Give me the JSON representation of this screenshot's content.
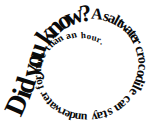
{
  "figure": {
    "kind": "spiral-text-graphic",
    "full_text": "Did you know? A saltwater crocodile can stay underwater for more than an hour.",
    "background_color": "#ffffff",
    "text_color": "#0a0a0a",
    "spiral_direction": "clockwise-inward",
    "center": {
      "x": 78,
      "y": 65
    },
    "words": [
      {
        "text": "Did",
        "size": 26
      },
      {
        "text": "you",
        "size": 25
      },
      {
        "text": "know?",
        "size": 23
      },
      {
        "text": "A",
        "size": 16
      },
      {
        "text": "saltwater",
        "size": 15
      },
      {
        "text": "crocodile",
        "size": 14
      },
      {
        "text": "can",
        "size": 13
      },
      {
        "text": "stay",
        "size": 13
      },
      {
        "text": "underwater",
        "size": 12
      },
      {
        "text": "for",
        "size": 11
      },
      {
        "text": "more",
        "size": 11
      },
      {
        "text": "than",
        "size": 10
      },
      {
        "text": "an",
        "size": 10
      },
      {
        "text": "hour.",
        "size": 9
      }
    ],
    "letters": [
      {
        "ch": "D",
        "x": 19.0,
        "y": 106.0,
        "rot": -66,
        "size": 28
      },
      {
        "ch": "i",
        "x": 24.5,
        "y": 94.5,
        "rot": -70,
        "size": 28
      },
      {
        "ch": "d",
        "x": 28.0,
        "y": 86.0,
        "rot": -73,
        "size": 28
      },
      {
        "ch": " ",
        "x": 30.5,
        "y": 79.0,
        "rot": -75,
        "size": 28
      },
      {
        "ch": "y",
        "x": 33.0,
        "y": 71.0,
        "rot": -78,
        "size": 27
      },
      {
        "ch": "o",
        "x": 36.0,
        "y": 61.0,
        "rot": -81,
        "size": 27
      },
      {
        "ch": "u",
        "x": 39.0,
        "y": 51.5,
        "rot": -72,
        "size": 27
      },
      {
        "ch": " ",
        "x": 42.0,
        "y": 45.0,
        "rot": -66,
        "size": 27
      },
      {
        "ch": "k",
        "x": 47.5,
        "y": 37.0,
        "rot": -56,
        "size": 26
      },
      {
        "ch": "n",
        "x": 55.5,
        "y": 29.0,
        "rot": -44,
        "size": 26
      },
      {
        "ch": "o",
        "x": 64.5,
        "y": 22.5,
        "rot": -33,
        "size": 25
      },
      {
        "ch": "w",
        "x": 75.0,
        "y": 18.0,
        "rot": -21,
        "size": 25
      },
      {
        "ch": "?",
        "x": 86.0,
        "y": 15.5,
        "rot": -10,
        "size": 24
      },
      {
        "ch": "A",
        "x": 97.0,
        "y": 15.5,
        "rot": 6,
        "size": 16
      },
      {
        "ch": "s",
        "x": 106.0,
        "y": 17.5,
        "rot": 17,
        "size": 15
      },
      {
        "ch": "a",
        "x": 111.5,
        "y": 19.5,
        "rot": 24,
        "size": 15
      },
      {
        "ch": "l",
        "x": 116.0,
        "y": 21.5,
        "rot": 29,
        "size": 15
      },
      {
        "ch": "t",
        "x": 119.5,
        "y": 23.5,
        "rot": 33,
        "size": 15
      },
      {
        "ch": "w",
        "x": 124.0,
        "y": 26.5,
        "rot": 40,
        "size": 15
      },
      {
        "ch": "a",
        "x": 128.5,
        "y": 30.5,
        "rot": 47,
        "size": 15
      },
      {
        "ch": "t",
        "x": 131.5,
        "y": 34.0,
        "rot": 52,
        "size": 15
      },
      {
        "ch": "e",
        "x": 134.0,
        "y": 37.5,
        "rot": 57,
        "size": 15
      },
      {
        "ch": "r",
        "x": 136.0,
        "y": 41.5,
        "rot": 62,
        "size": 15
      },
      {
        "ch": "c",
        "x": 139.0,
        "y": 49.5,
        "rot": 72,
        "size": 14
      },
      {
        "ch": "r",
        "x": 140.5,
        "y": 55.0,
        "rot": 78,
        "size": 14
      },
      {
        "ch": "o",
        "x": 141.5,
        "y": 60.5,
        "rot": 84,
        "size": 14
      },
      {
        "ch": "c",
        "x": 141.5,
        "y": 67.0,
        "rot": 92,
        "size": 14
      },
      {
        "ch": "o",
        "x": 140.5,
        "y": 73.5,
        "rot": 99,
        "size": 14
      },
      {
        "ch": "d",
        "x": 139.0,
        "y": 79.0,
        "rot": 106,
        "size": 14
      },
      {
        "ch": "i",
        "x": 137.0,
        "y": 83.5,
        "rot": 112,
        "size": 14
      },
      {
        "ch": "l",
        "x": 135.5,
        "y": 87.0,
        "rot": 116,
        "size": 14
      },
      {
        "ch": "e",
        "x": 133.0,
        "y": 91.5,
        "rot": 122,
        "size": 14
      },
      {
        "ch": "c",
        "x": 127.0,
        "y": 99.0,
        "rot": 133,
        "size": 13
      },
      {
        "ch": "a",
        "x": 122.5,
        "y": 103.5,
        "rot": 140,
        "size": 13
      },
      {
        "ch": "n",
        "x": 118.0,
        "y": 107.0,
        "rot": 147,
        "size": 13
      },
      {
        "ch": "s",
        "x": 110.0,
        "y": 111.5,
        "rot": 157,
        "size": 13
      },
      {
        "ch": "t",
        "x": 105.0,
        "y": 113.5,
        "rot": 163,
        "size": 13
      },
      {
        "ch": "a",
        "x": 100.0,
        "y": 115.0,
        "rot": 168,
        "size": 13
      },
      {
        "ch": "y",
        "x": 94.5,
        "y": 116.0,
        "rot": 174,
        "size": 13
      },
      {
        "ch": "u",
        "x": 84.0,
        "y": 116.5,
        "rot": 183,
        "size": 12
      },
      {
        "ch": "n",
        "x": 78.0,
        "y": 116.0,
        "rot": 189,
        "size": 12
      },
      {
        "ch": "d",
        "x": 72.5,
        "y": 115.0,
        "rot": 195,
        "size": 12
      },
      {
        "ch": "e",
        "x": 67.5,
        "y": 113.5,
        "rot": 201,
        "size": 12
      },
      {
        "ch": "r",
        "x": 63.0,
        "y": 111.5,
        "rot": 207,
        "size": 12
      },
      {
        "ch": "w",
        "x": 57.5,
        "y": 108.5,
        "rot": 214,
        "size": 12
      },
      {
        "ch": "a",
        "x": 53.0,
        "y": 105.0,
        "rot": 221,
        "size": 12
      },
      {
        "ch": "t",
        "x": 49.5,
        "y": 101.5,
        "rot": 227,
        "size": 12
      },
      {
        "ch": "e",
        "x": 46.5,
        "y": 98.0,
        "rot": 233,
        "size": 12
      },
      {
        "ch": "r",
        "x": 44.0,
        "y": 94.0,
        "rot": 239,
        "size": 12
      },
      {
        "ch": "f",
        "x": 41.0,
        "y": 87.0,
        "rot": 249,
        "size": 11
      },
      {
        "ch": "o",
        "x": 39.5,
        "y": 82.0,
        "rot": 255,
        "size": 11
      },
      {
        "ch": "r",
        "x": 38.5,
        "y": 77.5,
        "rot": 261,
        "size": 11
      },
      {
        "ch": "m",
        "x": 38.5,
        "y": 70.0,
        "rot": 271,
        "size": 11
      },
      {
        "ch": "o",
        "x": 39.5,
        "y": 64.5,
        "rot": 279,
        "size": 11
      },
      {
        "ch": "r",
        "x": 41.0,
        "y": 60.0,
        "rot": 286,
        "size": 11
      },
      {
        "ch": "e",
        "x": 43.0,
        "y": 55.5,
        "rot": 293,
        "size": 11
      },
      {
        "ch": "t",
        "x": 48.0,
        "y": 48.5,
        "rot": 305,
        "size": 10
      },
      {
        "ch": "h",
        "x": 52.0,
        "y": 44.5,
        "rot": 313,
        "size": 10
      },
      {
        "ch": "a",
        "x": 56.0,
        "y": 41.5,
        "rot": 320,
        "size": 10
      },
      {
        "ch": "n",
        "x": 60.5,
        "y": 39.0,
        "rot": 327,
        "size": 10
      },
      {
        "ch": "a",
        "x": 68.5,
        "y": 36.5,
        "rot": 338,
        "size": 10
      },
      {
        "ch": "n",
        "x": 74.0,
        "y": 35.5,
        "rot": 345,
        "size": 10
      },
      {
        "ch": "h",
        "x": 83.5,
        "y": 36.0,
        "rot": 357,
        "size": 9
      },
      {
        "ch": "o",
        "x": 89.0,
        "y": 37.0,
        "rot": 4,
        "size": 9
      },
      {
        "ch": "u",
        "x": 94.0,
        "y": 38.5,
        "rot": 11,
        "size": 9
      },
      {
        "ch": "r",
        "x": 98.5,
        "y": 40.5,
        "rot": 18,
        "size": 9
      },
      {
        "ch": ".",
        "x": 101.5,
        "y": 42.5,
        "rot": 24,
        "size": 9
      }
    ]
  }
}
